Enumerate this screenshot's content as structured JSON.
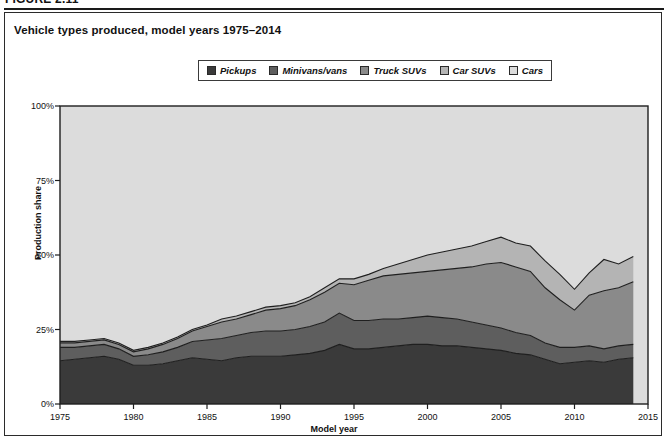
{
  "figure": {
    "number": "FIGURE 2.11",
    "title": "Vehicle types produced, model years 1975–2014"
  },
  "legend": {
    "items": [
      {
        "label": "Pickups",
        "color": "#3a3a3a"
      },
      {
        "label": "Minivans/vans",
        "color": "#5e5e5e"
      },
      {
        "label": "Truck SUVs",
        "color": "#8a8a8a"
      },
      {
        "label": "Car SUVs",
        "color": "#b4b4b4"
      },
      {
        "label": "Cars",
        "color": "#dcdcdc"
      }
    ]
  },
  "axes": {
    "y_title": "Production share",
    "x_title": "Model year",
    "y_ticks": [
      "0%",
      "25%",
      "50%",
      "75%",
      "100%"
    ],
    "x_ticks": [
      "1975",
      "1980",
      "1985",
      "1990",
      "1995",
      "2000",
      "2005",
      "2010",
      "2015"
    ]
  },
  "chart_data": {
    "type": "area",
    "stacked": true,
    "title": "Vehicle types produced, model years 1975–2014",
    "xlabel": "Model year",
    "ylabel": "Production share",
    "xlim": [
      1975,
      2015
    ],
    "ylim": [
      0,
      100
    ],
    "grid": false,
    "legend_position": "top-center",
    "x": [
      1975,
      1976,
      1977,
      1978,
      1979,
      1980,
      1981,
      1982,
      1983,
      1984,
      1985,
      1986,
      1987,
      1988,
      1989,
      1990,
      1991,
      1992,
      1993,
      1994,
      1995,
      1996,
      1997,
      1998,
      1999,
      2000,
      2001,
      2002,
      2003,
      2004,
      2005,
      2006,
      2007,
      2008,
      2009,
      2010,
      2011,
      2012,
      2013,
      2014
    ],
    "series": [
      {
        "name": "Pickups",
        "color": "#3a3a3a",
        "values": [
          14.5,
          15.0,
          15.5,
          16.0,
          15.0,
          13.0,
          13.0,
          13.5,
          14.5,
          15.5,
          15.0,
          14.5,
          15.5,
          16.0,
          16.0,
          16.0,
          16.5,
          17.0,
          18.0,
          20.0,
          18.5,
          18.5,
          19.0,
          19.5,
          20.0,
          20.0,
          19.5,
          19.5,
          19.0,
          18.5,
          18.0,
          17.0,
          16.5,
          15.0,
          13.5,
          14.0,
          14.5,
          14.0,
          15.0,
          15.5
        ]
      },
      {
        "name": "Minivans/vans",
        "color": "#5e5e5e",
        "values": [
          4.5,
          4.0,
          4.0,
          4.0,
          3.5,
          3.0,
          3.5,
          4.0,
          4.5,
          5.5,
          6.5,
          7.5,
          7.5,
          8.0,
          8.5,
          8.5,
          8.5,
          9.0,
          9.5,
          10.5,
          9.5,
          9.5,
          9.5,
          9.0,
          9.0,
          9.5,
          9.5,
          9.0,
          8.5,
          8.0,
          7.5,
          7.0,
          6.5,
          5.5,
          5.5,
          5.0,
          5.0,
          4.5,
          4.5,
          4.5
        ]
      },
      {
        "name": "Truck SUVs",
        "color": "#8a8a8a",
        "values": [
          1.5,
          1.5,
          1.5,
          1.5,
          1.5,
          1.5,
          2.0,
          2.5,
          3.0,
          3.5,
          4.5,
          5.5,
          5.5,
          6.0,
          7.0,
          7.5,
          8.0,
          9.0,
          10.0,
          10.0,
          12.0,
          13.5,
          14.5,
          15.0,
          15.0,
          15.0,
          16.0,
          17.0,
          18.5,
          20.5,
          22.0,
          22.0,
          21.5,
          18.5,
          16.0,
          12.5,
          17.0,
          19.5,
          19.5,
          21.0
        ]
      },
      {
        "name": "Car SUVs",
        "color": "#b4b4b4",
        "values": [
          0.5,
          0.5,
          0.5,
          0.5,
          0.5,
          0.5,
          0.5,
          0.5,
          0.5,
          0.5,
          0.5,
          1.0,
          1.0,
          1.0,
          1.0,
          1.0,
          1.0,
          1.0,
          1.5,
          1.5,
          2.0,
          2.0,
          2.5,
          3.5,
          4.5,
          5.5,
          6.0,
          6.5,
          7.0,
          7.5,
          8.5,
          8.0,
          8.5,
          9.0,
          8.5,
          7.0,
          7.5,
          10.5,
          8.0,
          8.5
        ]
      },
      {
        "name": "Cars",
        "color": "#dcdcdc",
        "values": [
          79.0,
          79.0,
          78.5,
          78.0,
          79.5,
          82.0,
          81.0,
          79.5,
          77.5,
          75.0,
          73.5,
          71.5,
          70.5,
          69.0,
          67.5,
          67.0,
          66.0,
          64.0,
          61.0,
          58.0,
          58.0,
          56.5,
          54.5,
          53.0,
          51.5,
          50.0,
          49.0,
          48.0,
          47.0,
          45.5,
          44.0,
          46.0,
          47.0,
          52.0,
          56.5,
          61.5,
          56.0,
          51.5,
          53.0,
          50.5
        ]
      }
    ]
  }
}
